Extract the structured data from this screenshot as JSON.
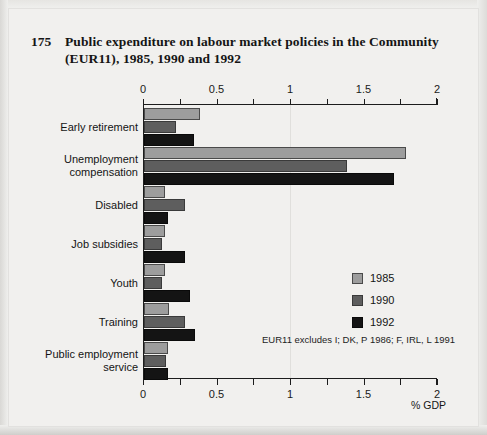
{
  "figure": {
    "number": "175",
    "title": "Public expenditure on labour market policies in the\nCommunity (EUR11), 1985, 1990 and 1992",
    "footnote": "EUR11 excludes I; DK, P 1986; F, IRL, L 1991",
    "axis_unit_label": "% GDP"
  },
  "legend": {
    "position": "right-middle",
    "items": [
      {
        "label": "1985",
        "color": "#9d9d9d"
      },
      {
        "label": "1990",
        "color": "#5e5e5e"
      },
      {
        "label": "1992",
        "color": "#141414"
      }
    ]
  },
  "chart_data": {
    "type": "bar",
    "orientation": "horizontal",
    "title": "Public expenditure on labour market policies in the Community (EUR11), 1985, 1990 and 1992",
    "subtitle": "",
    "xlabel": "% GDP",
    "ylabel": "",
    "xlim": [
      0,
      2
    ],
    "xticks": [
      0,
      0.5,
      1,
      1.5,
      2
    ],
    "xtick_labels": [
      "0",
      "0.5",
      "1",
      "1.5",
      "2"
    ],
    "minor_xticks": [
      0.25,
      0.75,
      1.25,
      1.75
    ],
    "grid": false,
    "axis_duplicated_top_and_bottom": true,
    "annotations": [
      "EUR11 excludes I; DK, P 1986; F, IRL, L 1991"
    ],
    "categories": [
      "Early retirement",
      "Unemployment\ncompensation",
      "Disabled",
      "Job subsidies",
      "Youth",
      "Training",
      "Public employment\nservice"
    ],
    "series": [
      {
        "name": "1985",
        "color": "#9d9d9d",
        "values": [
          0.38,
          1.78,
          0.14,
          0.14,
          0.14,
          0.17,
          0.16
        ]
      },
      {
        "name": "1990",
        "color": "#5e5e5e",
        "values": [
          0.22,
          1.38,
          0.28,
          0.12,
          0.12,
          0.28,
          0.15
        ]
      },
      {
        "name": "1992",
        "color": "#141414",
        "values": [
          0.34,
          1.7,
          0.16,
          0.28,
          0.31,
          0.35,
          0.16
        ]
      }
    ]
  }
}
